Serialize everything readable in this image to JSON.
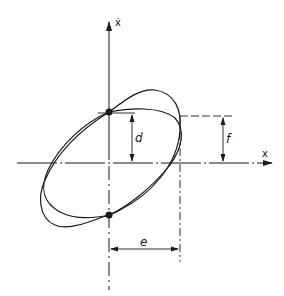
{
  "diagram": {
    "type": "phase-plane hysteresis loops",
    "axes": {
      "vertical_label": "ẋ",
      "horizontal_label": "x"
    },
    "dimensions": {
      "d_label": "d",
      "f_label": "f",
      "e_label": "e"
    },
    "points": [
      {
        "name": "upper-intersection",
        "on": "vertical-axis"
      },
      {
        "name": "lower-intersection",
        "on": "vertical-axis"
      }
    ],
    "curves": [
      {
        "name": "outer-ellipse-loop"
      },
      {
        "name": "inner-ellipse-loop"
      }
    ],
    "colors": {
      "ink": "#1a1a1a",
      "background": "#ffffff"
    }
  }
}
